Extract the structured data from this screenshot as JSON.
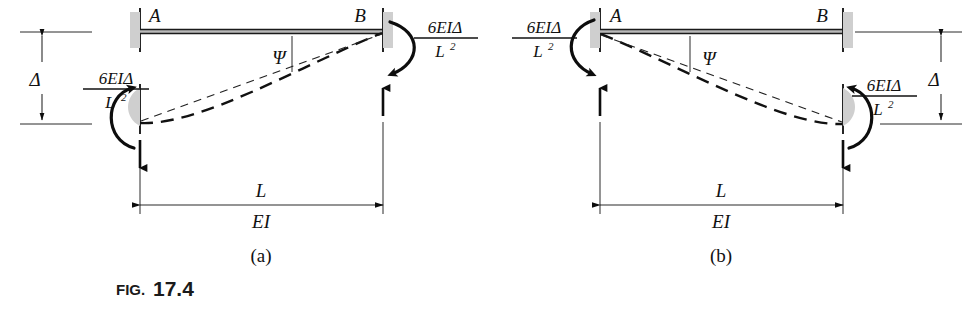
{
  "figure": {
    "fig_prefix": "FIG.",
    "fig_number": "17.4",
    "caption_full": "FIG. 17.4",
    "background_color": "#ffffff",
    "ink_color": "#111111"
  },
  "panels": [
    {
      "id": "a",
      "sublabel": "(a)",
      "node_left_label": "A",
      "node_right_label": "B",
      "rotation_symbol": "Ψ",
      "displacement_symbol": "Δ",
      "span_label": "L",
      "stiffness_label": "EI",
      "moments": [
        {
          "position": "left-end-A",
          "numerator": "6EIΔ",
          "denominator": "L",
          "denominator_exponent": "2",
          "full": "6EIΔ/L²",
          "sense": "counterclockwise"
        },
        {
          "position": "right-end-B",
          "numerator": "6EIΔ",
          "denominator": "L",
          "denominator_exponent": "2",
          "full": "6EIΔ/L²",
          "sense": "clockwise"
        }
      ],
      "forces": [
        {
          "position": "left-end-A",
          "direction": "down"
        },
        {
          "position": "right-end-B",
          "direction": "up"
        }
      ],
      "description": "Member AB with support A displaced downward by Delta"
    },
    {
      "id": "b",
      "sublabel": "(b)",
      "node_left_label": "A",
      "node_right_label": "B",
      "rotation_symbol": "Ψ",
      "displacement_symbol": "Δ",
      "span_label": "L",
      "stiffness_label": "EI",
      "moments": [
        {
          "position": "left-end-A",
          "numerator": "6EIΔ",
          "denominator": "L",
          "denominator_exponent": "2",
          "full": "6EIΔ/L²",
          "sense": "clockwise"
        },
        {
          "position": "right-end-B",
          "numerator": "6EIΔ",
          "denominator": "L",
          "denominator_exponent": "2",
          "full": "6EIΔ/L²",
          "sense": "counterclockwise"
        }
      ],
      "forces": [
        {
          "position": "left-end-A",
          "direction": "up"
        },
        {
          "position": "right-end-B",
          "direction": "down"
        }
      ],
      "description": "Member AB with support B displaced downward by Delta"
    }
  ]
}
